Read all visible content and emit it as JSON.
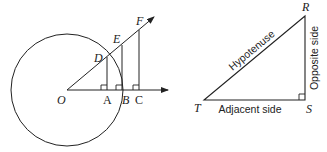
{
  "figure_left": {
    "title": "Unit circle with similar right triangles",
    "points": {
      "O": {
        "label": "O",
        "x": 67,
        "y": 90
      },
      "A": {
        "label": "A",
        "x": 107,
        "y": 90
      },
      "B": {
        "label": "B",
        "x": 122,
        "y": 90
      },
      "C": {
        "label": "C",
        "x": 139,
        "y": 90
      },
      "D": {
        "label": "D",
        "x": 107,
        "y": 57
      },
      "E": {
        "label": "E",
        "x": 122,
        "y": 45
      },
      "F": {
        "label": "F",
        "x": 139,
        "y": 30
      }
    },
    "circle": {
      "cx": 67,
      "cy": 90,
      "r": 56
    },
    "labels": {
      "O": "O",
      "A": "A",
      "B": "B",
      "C": "C",
      "D": "D",
      "E": "E",
      "F": "F"
    }
  },
  "figure_right": {
    "title": "Right triangle side names",
    "vertices": {
      "R": {
        "label": "R",
        "x": 305,
        "y": 16
      },
      "S": {
        "label": "S",
        "x": 305,
        "y": 100
      },
      "T": {
        "label": "T",
        "x": 204,
        "y": 100
      }
    },
    "labels": {
      "R": "R",
      "S": "S",
      "T": "T",
      "hypotenuse": "Hypotenuse",
      "opposite": "Opposite side",
      "adjacent": "Adjacent side"
    }
  },
  "colors": {
    "stroke": "#222222",
    "background": "#ffffff"
  }
}
